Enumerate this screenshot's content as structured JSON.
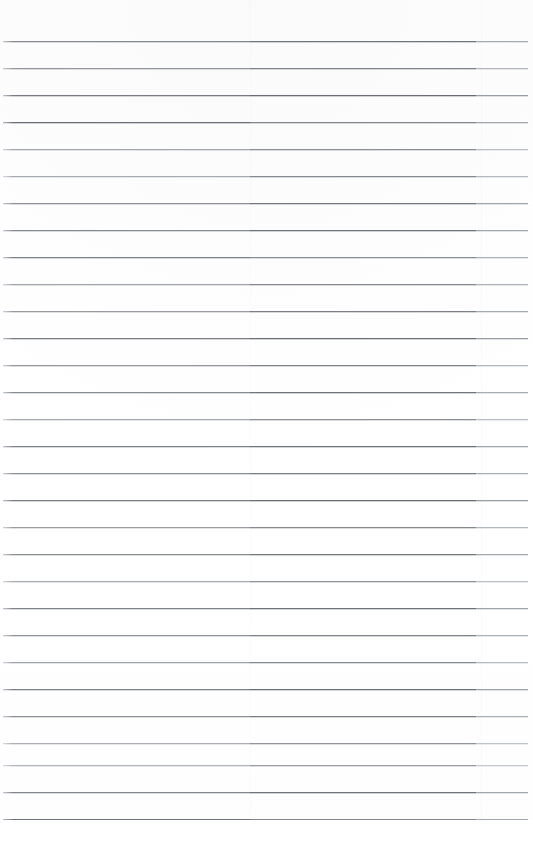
{
  "document": {
    "kind": "scanned-ruled-paper",
    "title": "Blank lined notebook page",
    "page_width": 533,
    "page_height": 866,
    "background_color": "#ffffff",
    "content_text": "",
    "has_handwriting": false,
    "has_printed_text": false
  },
  "ruling": {
    "line_count": 29,
    "first_line_y": 42,
    "line_spacing": 27,
    "line_left_x": 3,
    "line_right_x": 528,
    "line_width": 525,
    "stroke_thickness": 1,
    "base_color": "#6e7277",
    "top_margin": 42,
    "bottom_margin": 46,
    "left_margin": 3,
    "right_margin": 5,
    "lines": [
      {
        "y": 42,
        "color": "#74787d",
        "opacity": 0.86,
        "seg_b_color": "#5f636a",
        "seg_c_color": "#9aa0a6"
      },
      {
        "y": 69,
        "color": "#7d8186",
        "opacity": 0.82,
        "seg_b_color": "#65696f",
        "seg_c_color": "#a4a9af"
      },
      {
        "y": 96,
        "color": "#6b6f75",
        "opacity": 0.9,
        "seg_b_color": "#5a5e65",
        "seg_c_color": "#8e949b"
      },
      {
        "y": 123,
        "color": "#5f646b",
        "opacity": 0.92,
        "seg_b_color": "#7a7e84",
        "seg_c_color": "#9aa0a6"
      },
      {
        "y": 150,
        "color": "#8a8f95",
        "opacity": 0.78,
        "seg_b_color": "#6c7076",
        "seg_c_color": "#a8adb3"
      },
      {
        "y": 177,
        "color": "#8f949a",
        "opacity": 0.76,
        "seg_b_color": "#62666d",
        "seg_c_color": "#9ea4aa"
      },
      {
        "y": 204,
        "color": "#7a7e84",
        "opacity": 0.84,
        "seg_b_color": "#5d6168",
        "seg_c_color": "#8f959b"
      },
      {
        "y": 231,
        "color": "#74797f",
        "opacity": 0.86,
        "seg_b_color": "#5a5e65",
        "seg_c_color": "#959aa1"
      },
      {
        "y": 258,
        "color": "#6d7177",
        "opacity": 0.88,
        "seg_b_color": "#7c8086",
        "seg_c_color": "#a0a6ac"
      },
      {
        "y": 285,
        "color": "#878c92",
        "opacity": 0.79,
        "seg_b_color": "#666a71",
        "seg_c_color": "#9aa0a6"
      },
      {
        "y": 312,
        "color": "#81868c",
        "opacity": 0.81,
        "seg_b_color": "#5f636a",
        "seg_c_color": "#92989e"
      },
      {
        "y": 339,
        "color": "#696d74",
        "opacity": 0.89,
        "seg_b_color": "#5b5f66",
        "seg_c_color": "#8d939a"
      },
      {
        "y": 366,
        "color": "#7e8288",
        "opacity": 0.83,
        "seg_b_color": "#676b72",
        "seg_c_color": "#a2a8ae"
      },
      {
        "y": 393,
        "color": "#747981",
        "opacity": 0.86,
        "seg_b_color": "#5c6067",
        "seg_c_color": "#9aa0a6"
      },
      {
        "y": 420,
        "color": "#8b9096",
        "opacity": 0.77,
        "seg_b_color": "#6a6e75",
        "seg_c_color": "#a6abb1"
      },
      {
        "y": 447,
        "color": "#6f737a",
        "opacity": 0.88,
        "seg_b_color": "#5d6168",
        "seg_c_color": "#949aa0"
      },
      {
        "y": 474,
        "color": "#797d84",
        "opacity": 0.84,
        "seg_b_color": "#63676e",
        "seg_c_color": "#9da3a9"
      },
      {
        "y": 501,
        "color": "#6b6f76",
        "opacity": 0.9,
        "seg_b_color": "#5a5e65",
        "seg_c_color": "#8e949b"
      },
      {
        "y": 528,
        "color": "#82878d",
        "opacity": 0.8,
        "seg_b_color": "#686c73",
        "seg_c_color": "#a1a7ad"
      },
      {
        "y": 555,
        "color": "#767a81",
        "opacity": 0.85,
        "seg_b_color": "#5e6269",
        "seg_c_color": "#979da3"
      },
      {
        "y": 582,
        "color": "#8d9298",
        "opacity": 0.76,
        "seg_b_color": "#6b6f76",
        "seg_c_color": "#a7acb2"
      },
      {
        "y": 609,
        "color": "#70747b",
        "opacity": 0.88,
        "seg_b_color": "#5b5f66",
        "seg_c_color": "#92989e"
      },
      {
        "y": 636,
        "color": "#7b7f86",
        "opacity": 0.83,
        "seg_b_color": "#646870",
        "seg_c_color": "#9ea4aa"
      },
      {
        "y": 663,
        "color": "#878c92",
        "opacity": 0.79,
        "seg_b_color": "#686c73",
        "seg_c_color": "#a3a9af"
      },
      {
        "y": 690,
        "color": "#6e727a",
        "opacity": 0.89,
        "seg_b_color": "#5c6067",
        "seg_c_color": "#91979d"
      },
      {
        "y": 717,
        "color": "#797e85",
        "opacity": 0.84,
        "seg_b_color": "#62666d",
        "seg_c_color": "#9ca2a8"
      },
      {
        "y": 744,
        "color": "#90959b",
        "opacity": 0.74,
        "seg_b_color": "#6d7178",
        "seg_c_color": "#aab0b6"
      },
      {
        "y": 766,
        "color": "#9298a0",
        "opacity": 0.7,
        "seg_b_color": "#70747b",
        "seg_c_color": "#adb3b9"
      },
      {
        "y": 793,
        "color": "#72767d",
        "opacity": 0.87,
        "seg_b_color": "#5d6168",
        "seg_c_color": "#969ca2"
      },
      {
        "y": 820,
        "color": "#646870",
        "opacity": 0.92,
        "seg_b_color": "#797d84",
        "seg_c_color": "#9aa0a6"
      }
    ]
  },
  "artifacts": {
    "seam_left_x": 250,
    "seam_right_x": 481,
    "seam_color": "#000000"
  }
}
